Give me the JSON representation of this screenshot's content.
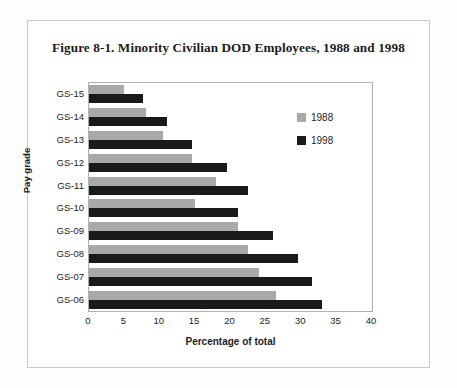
{
  "figure": {
    "title": "Figure  8-1. Minority Civilian DOD Employees, 1988 and 1998"
  },
  "legend": {
    "items": [
      {
        "label": "1988",
        "color": "#a9a9a9"
      },
      {
        "label": "1998",
        "color": "#1a1a1a"
      }
    ]
  },
  "chart_data": {
    "type": "bar",
    "orientation": "horizontal",
    "title": "Figure  8-1. Minority Civilian DOD Employees, 1988 and 1998",
    "xlabel": "Percentage of total",
    "ylabel": "Pay grade",
    "categories": [
      "GS-15",
      "GS-14",
      "GS-13",
      "GS-12",
      "GS-11",
      "GS-10",
      "GS-09",
      "GS-08",
      "GS-07",
      "GS-06"
    ],
    "series": [
      {
        "name": "1988",
        "color": "#a9a9a9",
        "values": [
          5.0,
          8.0,
          10.5,
          14.5,
          18.0,
          15.0,
          21.0,
          22.5,
          24.0,
          26.5
        ]
      },
      {
        "name": "1998",
        "color": "#1a1a1a",
        "values": [
          7.7,
          11.0,
          14.5,
          19.5,
          22.5,
          21.0,
          26.0,
          29.5,
          31.5,
          33.0
        ]
      }
    ],
    "xlim": [
      0,
      40
    ],
    "xticks": [
      0,
      5,
      10,
      15,
      20,
      25,
      30,
      35,
      40
    ],
    "xtick_labels": [
      "0",
      "5",
      "10",
      "15",
      "20",
      "25",
      "30",
      "35",
      "40"
    ],
    "grid": false,
    "legend_position": "upper right"
  }
}
